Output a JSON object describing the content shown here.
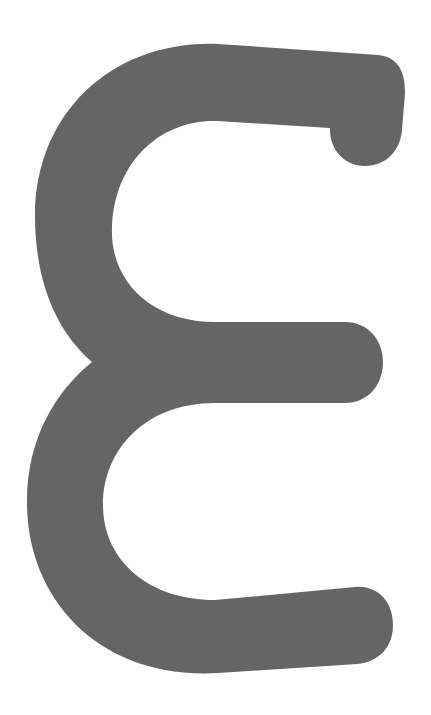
{
  "glyph": {
    "character": "ε",
    "name": "Greek small letter epsilon",
    "fill_color": "#656565",
    "background_color": "#ffffff"
  }
}
